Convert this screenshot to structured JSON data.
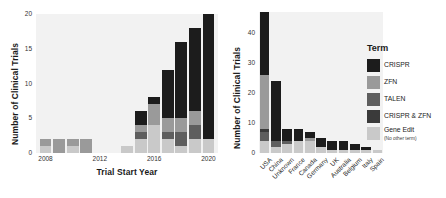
{
  "figure": {
    "background": "#ffffff",
    "panel_background": "#f2f2f2"
  },
  "legend": {
    "title": "Term",
    "items": [
      {
        "label": "CRISPR",
        "sub": "",
        "color": "#1c1c1c"
      },
      {
        "label": "ZFN",
        "sub": "",
        "color": "#9a9a9a"
      },
      {
        "label": "TALEN",
        "sub": "",
        "color": "#5e5e5e"
      },
      {
        "label": "CRISPR & ZFN",
        "sub": "",
        "color": "#3a3a3a"
      },
      {
        "label": "Gene Edit",
        "sub": "(No other term)",
        "color": "#c9c9c9"
      }
    ]
  },
  "chart_data": [
    {
      "type": "bar",
      "id": "trials-by-year",
      "stacked": true,
      "title": "",
      "xlabel": "Trial Start Year",
      "ylabel": "Number of Clinical Trials",
      "ylim": [
        0,
        20
      ],
      "yticks": [
        0,
        5,
        10,
        15,
        20
      ],
      "ytick_labels": [
        "0",
        "5",
        "10",
        "15",
        "20"
      ],
      "xticks": [
        2008,
        2012,
        2016,
        2020
      ],
      "xtick_labels": [
        "2008",
        "2012",
        "2016",
        "2020"
      ],
      "grid": false,
      "legend_position": "right-outside",
      "categories": [
        2008,
        2009,
        2010,
        2011,
        2014,
        2015,
        2016,
        2017,
        2018,
        2019,
        2020
      ],
      "series": [
        {
          "name": "Gene Edit",
          "color": "#c9c9c9",
          "values": [
            1,
            0,
            1,
            0,
            1,
            2,
            4,
            2,
            1,
            2,
            2
          ]
        },
        {
          "name": "TALEN",
          "color": "#5e5e5e",
          "values": [
            0,
            0,
            0,
            0,
            0,
            1,
            0,
            1,
            2,
            2,
            0
          ]
        },
        {
          "name": "ZFN",
          "color": "#9a9a9a",
          "values": [
            1,
            2,
            1,
            2,
            0,
            1,
            3,
            2,
            2,
            2,
            0
          ]
        },
        {
          "name": "CRISPR",
          "color": "#1c1c1c",
          "values": [
            0,
            0,
            0,
            0,
            0,
            2,
            1,
            7,
            11,
            12,
            18
          ]
        }
      ]
    },
    {
      "type": "bar",
      "id": "trials-by-country",
      "stacked": true,
      "title": "",
      "xlabel": "",
      "ylabel": "Number of Clinical Trials",
      "ylim": [
        0,
        47
      ],
      "yticks": [
        0,
        10,
        20,
        30,
        40
      ],
      "ytick_labels": [
        "0",
        "10",
        "20",
        "30",
        "40"
      ],
      "grid": false,
      "legend_position": "right-outside",
      "categories": [
        "USA",
        "China",
        "Unknown",
        "France",
        "Canada",
        "Germany",
        "UK",
        "Australia",
        "Belgium",
        "Italy",
        "Spain"
      ],
      "series": [
        {
          "name": "Gene Edit",
          "color": "#c9c9c9",
          "values": [
            4,
            2,
            3,
            4,
            4,
            2,
            1,
            1,
            1,
            1,
            1
          ]
        },
        {
          "name": "TALEN",
          "color": "#5e5e5e",
          "values": [
            3,
            2,
            1,
            0,
            0,
            0,
            0,
            0,
            0,
            0,
            0
          ]
        },
        {
          "name": "CRISPR & ZFN",
          "color": "#3a3a3a",
          "values": [
            1,
            0,
            0,
            0,
            0,
            0,
            0,
            0,
            0,
            0,
            0
          ]
        },
        {
          "name": "ZFN",
          "color": "#9a9a9a",
          "values": [
            18,
            0,
            0,
            0,
            1,
            0,
            0,
            0,
            0,
            0,
            0
          ]
        },
        {
          "name": "CRISPR",
          "color": "#1c1c1c",
          "values": [
            21,
            20,
            4,
            4,
            2,
            3,
            3,
            3,
            2,
            1,
            0
          ]
        }
      ]
    }
  ]
}
